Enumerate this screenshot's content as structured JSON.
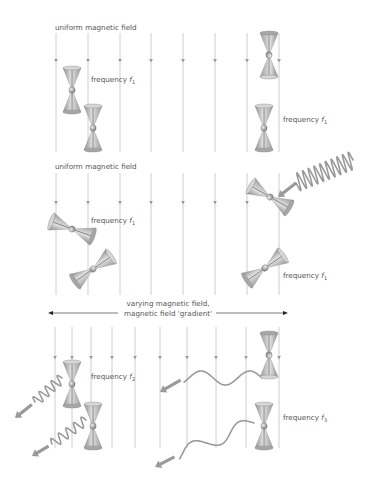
{
  "panels": [
    {
      "id": "panel-1",
      "title": "uniform magnetic field",
      "title_pos": [
        55,
        24
      ],
      "field_lines_x": [
        56,
        88,
        120,
        151,
        183,
        215,
        247,
        279
      ],
      "line_top": 33,
      "line_bottom": 152,
      "arrow_y": 61,
      "spins": [
        {
          "x": 72,
          "y": 90,
          "angle": 0,
          "label": "frequency",
          "symbol": "f",
          "sub": "1",
          "label_pos": [
            91,
            75
          ]
        },
        {
          "x": 93,
          "y": 128,
          "angle": 0
        },
        {
          "x": 269,
          "y": 55,
          "angle": 180
        },
        {
          "x": 264,
          "y": 128,
          "angle": 0,
          "label": "frequency",
          "symbol": "f",
          "sub": "1",
          "label_pos": [
            283,
            115
          ]
        }
      ],
      "waves": []
    },
    {
      "id": "panel-2",
      "title": "uniform magnetic field",
      "title_pos": [
        55,
        163
      ],
      "field_lines_x": [
        56,
        88,
        120,
        151,
        183,
        215,
        247,
        279
      ],
      "line_top": 173,
      "line_bottom": 295,
      "arrow_y": 203,
      "spins": [
        {
          "x": 72,
          "y": 229,
          "angle": -70,
          "label": "frequency",
          "symbol": "f",
          "sub": "1",
          "label_pos": [
            91,
            216
          ]
        },
        {
          "x": 93,
          "y": 269,
          "angle": 55
        },
        {
          "x": 270,
          "y": 197,
          "angle": -60
        },
        {
          "x": 265,
          "y": 268,
          "angle": 55,
          "label": "frequency",
          "symbol": "f",
          "sub": "1",
          "label_pos": [
            283,
            271
          ]
        }
      ],
      "waves": [
        {
          "type": "incoming-tight",
          "x1": 296,
          "y1": 183,
          "x2": 353,
          "y2": 160,
          "cycles": 10,
          "amp": 9,
          "arrow_to": [
            278,
            197
          ]
        }
      ]
    },
    {
      "id": "panel-3",
      "title_lines": [
        "varying magnetic field,",
        "magnetic field 'gradient'"
      ],
      "title_center": [
        168,
        307
      ],
      "gradient_arrow": {
        "x1": 48,
        "x2": 288,
        "y": 313
      },
      "field_lines_x": [
        55,
        72,
        91,
        112,
        135,
        160,
        187,
        216,
        246,
        279
      ],
      "line_top": 327,
      "line_bottom": 448,
      "arrow_y": 358,
      "spins": [
        {
          "x": 72,
          "y": 384,
          "angle": 0,
          "label": "frequency",
          "symbol": "f",
          "sub": "2",
          "label_pos": [
            91,
            372
          ]
        },
        {
          "x": 93,
          "y": 426,
          "angle": 0
        },
        {
          "x": 269,
          "y": 355,
          "angle": 180
        },
        {
          "x": 264,
          "y": 426,
          "angle": 0,
          "label": "frequency",
          "symbol": "f",
          "sub": "3",
          "label_pos": [
            283,
            413
          ]
        }
      ],
      "waves": [
        {
          "type": "outgoing-tight",
          "x1": 62,
          "y1": 378,
          "x2": 35,
          "y2": 402,
          "cycles": 4.5,
          "amp": 5,
          "arrow_end": [
            15,
            418
          ]
        },
        {
          "type": "outgoing-tight",
          "x1": 86,
          "y1": 420,
          "x2": 52,
          "y2": 444,
          "cycles": 4.5,
          "amp": 5,
          "arrow_end": [
            32,
            456
          ]
        },
        {
          "type": "outgoing-loose",
          "x1": 262,
          "y1": 378,
          "x2": 184,
          "y2": 378,
          "cycles": 1.6,
          "amp": 7,
          "slope": 1,
          "arrow_end": [
            160,
            392
          ]
        },
        {
          "type": "outgoing-loose",
          "x1": 254,
          "y1": 423,
          "x2": 178,
          "y2": 455,
          "cycles": 1.6,
          "amp": 7,
          "arrow_end": [
            155,
            467
          ]
        }
      ]
    }
  ],
  "colors": {
    "field_line": "#c8c8c8",
    "arrowhead": "#999999",
    "cone_light": "#e0e0e0",
    "cone_mid": "#b8b8b8",
    "cone_dark": "#8c8c8c",
    "wave": "#9a9a9a",
    "label": "#555555",
    "gradient_arrow": "#222222"
  }
}
